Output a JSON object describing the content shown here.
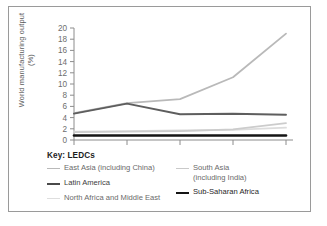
{
  "chart_data": {
    "type": "line",
    "title": "",
    "xlabel": "",
    "ylabel": "World manufacturing output (%)",
    "categories": [
      "1970",
      "1980",
      "1990",
      "1995",
      "2005"
    ],
    "ylim": [
      0,
      20
    ],
    "yticks": [
      0,
      2,
      4,
      6,
      8,
      10,
      12,
      14,
      16,
      18,
      20
    ],
    "ytick_labels": [
      "0",
      "2",
      "4",
      "6",
      "8",
      "10",
      "12",
      "14",
      "16",
      "18",
      "20"
    ],
    "grid": false,
    "legend_position": "below",
    "legend_title": "Key: LEDCs",
    "series": [
      {
        "name": "East Asia (including China)",
        "values": [
          4.8,
          6.6,
          7.3,
          11.2,
          19.0
        ],
        "color": "#b9b9b9",
        "width": 1.8
      },
      {
        "name": "Latin America",
        "values": [
          4.7,
          6.5,
          4.6,
          4.7,
          4.5
        ],
        "color": "#5e5e5e",
        "width": 1.9
      },
      {
        "name": "North Africa and Middle East",
        "values": [
          1.5,
          1.6,
          1.7,
          1.8,
          2.2
        ],
        "color": "#dcdcdc",
        "width": 1.8
      },
      {
        "name": "South Asia (including India)",
        "values": [
          1.4,
          1.5,
          1.6,
          1.9,
          3.0
        ],
        "color": "#cccccc",
        "width": 1.8
      },
      {
        "name": "Sub-Saharan Africa",
        "values": [
          0.8,
          0.8,
          0.8,
          0.8,
          0.8
        ],
        "color": "#151515",
        "width": 2.6
      }
    ]
  },
  "legend": {
    "title": "Key: LEDCs",
    "entries": [
      {
        "label": "East Asia (including China)",
        "color": "#b9b9b9",
        "thickness": "1.6px",
        "tone": ""
      },
      {
        "label": "Latin America",
        "color": "#4a4a4a",
        "thickness": "2.4px",
        "tone": "dark"
      },
      {
        "label": "North Africa and Middle East",
        "color": "#dedede",
        "thickness": "1.6px",
        "tone": ""
      },
      {
        "label": "South Asia\n(including India)",
        "color": "#c9c9c9",
        "thickness": "1.6px",
        "tone": ""
      },
      {
        "label": "Sub-Saharan Africa",
        "color": "#151515",
        "thickness": "2.6px",
        "tone": "black"
      }
    ]
  },
  "axis": {
    "ylabel": "World manufacturing output (%)",
    "x_tick_labels": [
      "1970",
      "1980",
      "1990",
      "1995",
      "2005"
    ],
    "y_tick_labels": [
      "20",
      "18",
      "16",
      "14",
      "12",
      "10",
      "8",
      "6",
      "4",
      "2",
      "0"
    ]
  },
  "colors": {
    "axis": "#8c8c8c",
    "tick_text": "#6e6e6e",
    "border": "#9a9a9a",
    "background": "#ffffff"
  }
}
